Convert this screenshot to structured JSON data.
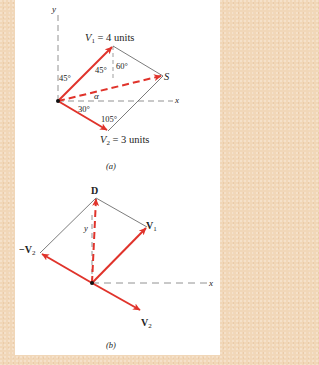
{
  "figure_a": {
    "caption": "(a)",
    "axes": {
      "x_label": "x",
      "y_label": "y"
    },
    "vectors": {
      "v1_label": "V",
      "v1_sub": "1",
      "v1_value": " = 4 units",
      "v2_label": "V",
      "v2_sub": "2",
      "v2_value": " = 3 units",
      "resultant_label": "S"
    },
    "angles": {
      "v1_from_y": "45°",
      "v1_inner": "45°",
      "top_right": "60°",
      "v2_below_x": "30°",
      "bottom": "105°",
      "alpha": "α"
    }
  },
  "figure_b": {
    "caption": "(b)",
    "axes": {
      "x_label": "x",
      "y_label": "y"
    },
    "vectors": {
      "v1_label": "V",
      "v1_sub": "1",
      "v2_label": "V",
      "v2_sub": "2",
      "neg_v2_label": "−V",
      "neg_v2_sub": "2",
      "difference_label": "D"
    }
  },
  "colors": {
    "vector_red": "#e0332b",
    "border_peach": "#f1d7b8",
    "line_gray": "#555555"
  }
}
